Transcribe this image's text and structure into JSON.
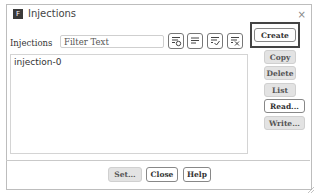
{
  "window": {
    "title": "Injections",
    "app_icon": "fluent-app-icon",
    "close_glyph": "×"
  },
  "filter": {
    "label": "Injections",
    "placeholder": "Filter Text",
    "value": "",
    "icons": [
      "filter-match-icon",
      "select-all-icon",
      "select-checked-icon",
      "clear-selection-icon"
    ]
  },
  "list": {
    "items": [
      "injection-0"
    ]
  },
  "side_buttons": {
    "create": "Create",
    "copy": "Copy",
    "delete": "Delete",
    "list": "List",
    "read": "Read...",
    "write": "Write..."
  },
  "footer_buttons": {
    "set": "Set...",
    "close": "Close",
    "help": "Help"
  }
}
